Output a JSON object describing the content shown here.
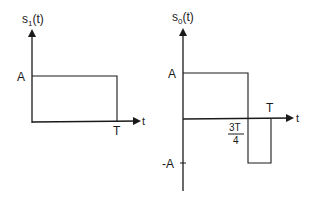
{
  "figure": {
    "plots": [
      {
        "id": "s1",
        "y_label_main": "s",
        "y_label_sub": "1",
        "y_label_tail": "(t)",
        "x_label": "t",
        "level_label": "A",
        "end_label": "T",
        "description": "Rectangular pulse of amplitude A from 0 to T"
      },
      {
        "id": "s0",
        "y_label_main": "s",
        "y_label_sub": "0",
        "y_label_tail": "(t)",
        "x_label": "t",
        "pos_level_label": "A",
        "neg_level_label": "-A",
        "end_label": "T",
        "switch_label_num": "3T",
        "switch_label_den": "4",
        "description": "Amplitude A from 0 to 3T/4, then -A from 3T/4 to T"
      }
    ],
    "colors": {
      "stroke": "#1a1a1a",
      "background": "#ffffff"
    }
  }
}
